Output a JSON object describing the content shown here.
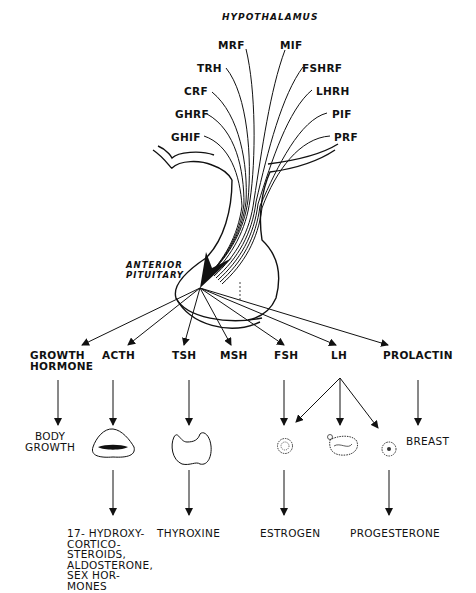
{
  "diagram": {
    "title": "HYPOTHALAMUS",
    "pituitary_label": "ANTERIOR\nPITUITARY",
    "releasing_factors_left": [
      {
        "label": "MRF"
      },
      {
        "label": "TRH"
      },
      {
        "label": "CRF"
      },
      {
        "label": "GHRF"
      },
      {
        "label": "GHIF"
      }
    ],
    "releasing_factors_right": [
      {
        "label": "MIF"
      },
      {
        "label": "FSHRF"
      },
      {
        "label": "LHRH"
      },
      {
        "label": "PIF"
      },
      {
        "label": "PRF"
      }
    ],
    "pituitary_hormones": [
      {
        "label": "GROWTH\nHORMONE"
      },
      {
        "label": "ACTH"
      },
      {
        "label": "TSH"
      },
      {
        "label": "MSH"
      },
      {
        "label": "FSH"
      },
      {
        "label": "LH"
      },
      {
        "label": "PROLACTIN"
      }
    ],
    "targets": [
      {
        "label": "BODY\nGROWTH",
        "icon": "body-growth-text"
      },
      {
        "label": "",
        "icon": "adrenal-gland-icon"
      },
      {
        "label": "",
        "icon": "thyroid-gland-icon"
      },
      {
        "label": "",
        "icon": "follicle-icon"
      },
      {
        "label": "",
        "icon": "ovulating-follicle-icon"
      },
      {
        "label": "",
        "icon": "corpus-luteum-icon"
      },
      {
        "label": "BREAST",
        "icon": "breast-text"
      }
    ],
    "end_products": [
      {
        "label": "17- HYDROXY-\nCORTICO-\nSTEROIDS,\nALDOSTERONE,\nSEX HOR-\nMONES"
      },
      {
        "label": "THYROXINE"
      },
      {
        "label": "ESTROGEN"
      },
      {
        "label": "PROGESTERONE"
      }
    ],
    "colors": {
      "ink": "#111111",
      "background": "#ffffff"
    }
  }
}
